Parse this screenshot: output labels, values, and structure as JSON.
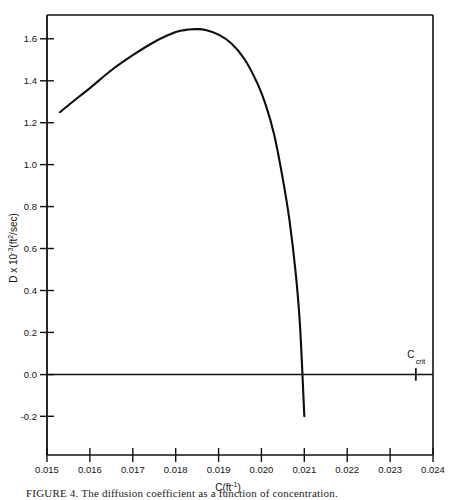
{
  "figure": {
    "caption": "FIGURE 4.  The diffusion coefficient as a function of concentration."
  },
  "chart_data": {
    "type": "line",
    "title": "",
    "xlabel": "C(ft⁻¹)",
    "ylabel": "D x 10⁻³(ft²/sec)",
    "xlim": [
      0.015,
      0.024
    ],
    "ylim": [
      -0.2,
      1.7
    ],
    "grid": false,
    "legend": null,
    "xticks": [
      "0.015",
      "0.016",
      "0.017",
      "0.018",
      "0.019",
      "0.020",
      "0.021",
      "0.022",
      "0.023",
      "0.024"
    ],
    "xtick_values": [
      0.015,
      0.016,
      0.017,
      0.018,
      0.019,
      0.02,
      0.021,
      0.022,
      0.023,
      0.024
    ],
    "yticks": [
      "1.6",
      "1.4",
      "1.2",
      "1.0",
      "0.8",
      "0.6",
      "0.4",
      "0.2",
      "0.0",
      "-0.2"
    ],
    "ytick_values": [
      1.6,
      1.4,
      1.2,
      1.0,
      0.8,
      0.6,
      0.4,
      0.2,
      0.0,
      -0.2
    ],
    "zero_line": 0.0,
    "series": [
      {
        "name": "D",
        "x": [
          0.0153,
          0.0156,
          0.016,
          0.0165,
          0.017,
          0.0175,
          0.018,
          0.0183,
          0.0185,
          0.0187,
          0.019,
          0.0193,
          0.0196,
          0.0199,
          0.0201,
          0.0203,
          0.0205,
          0.02065,
          0.0208,
          0.0209,
          0.021
        ],
        "y": [
          1.25,
          1.3,
          1.365,
          1.45,
          1.522,
          1.585,
          1.632,
          1.644,
          1.646,
          1.642,
          1.62,
          1.578,
          1.505,
          1.39,
          1.285,
          1.14,
          0.93,
          0.74,
          0.48,
          0.23,
          -0.2
        ]
      }
    ],
    "annotations": [
      {
        "name": "c-crit",
        "label_main": "C",
        "label_sub": "crit",
        "x": 0.0236,
        "y": 0.0
      }
    ]
  }
}
